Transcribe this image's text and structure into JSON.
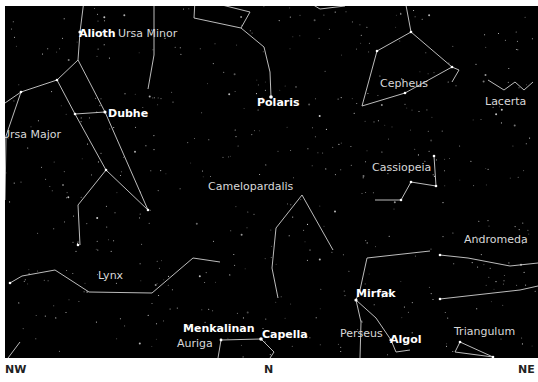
{
  "map": {
    "background": "#000000",
    "line_color": "#d0d0d0",
    "constellations": [
      {
        "name": "Ursa Minor",
        "x": 118,
        "y": 28
      },
      {
        "name": "Cepheus",
        "x": 380,
        "y": 78
      },
      {
        "name": "Lacerta",
        "x": 485,
        "y": 96
      },
      {
        "name": "Ursa Major",
        "x": 2,
        "y": 129
      },
      {
        "name": "Camelopardalis",
        "x": 208,
        "y": 181
      },
      {
        "name": "Cassiopeia",
        "x": 372,
        "y": 162
      },
      {
        "name": "Andromeda",
        "x": 464,
        "y": 234
      },
      {
        "name": "Lynx",
        "x": 98,
        "y": 270
      },
      {
        "name": "Perseus",
        "x": 340,
        "y": 328
      },
      {
        "name": "Auriga",
        "x": 177,
        "y": 338
      },
      {
        "name": "Triangulum",
        "x": 454,
        "y": 326
      }
    ],
    "stars": [
      {
        "name": "Alioth",
        "x": 79,
        "y": 28
      },
      {
        "name": "Dubhe",
        "x": 108,
        "y": 108
      },
      {
        "name": "Polaris",
        "x": 257,
        "y": 97
      },
      {
        "name": "Menkalinan",
        "x": 183,
        "y": 323
      },
      {
        "name": "Capella",
        "x": 262,
        "y": 329
      },
      {
        "name": "Mirfak",
        "x": 356,
        "y": 288
      },
      {
        "name": "Algol",
        "x": 390,
        "y": 334
      }
    ]
  },
  "compass": {
    "left": "NW",
    "center": "N",
    "right": "NE"
  }
}
